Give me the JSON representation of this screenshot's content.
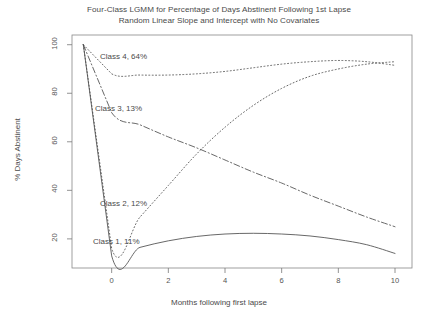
{
  "chart_data": {
    "type": "line",
    "title": "Four-Class LGMM for Percentage of Days Abstinent Following 1st Lapse",
    "subtitle": "Random Linear Slope and Intercept with No Covariates",
    "xlabel": "Months following first lapse",
    "ylabel": "% Days Abstinent",
    "xlim": [
      -1.4,
      10.6
    ],
    "ylim": [
      8,
      104
    ],
    "xticks": [
      0,
      2,
      4,
      6,
      8,
      10
    ],
    "xticklabels": [
      "0",
      "2",
      "4",
      "6",
      "8",
      "10"
    ],
    "yticks": [
      20,
      40,
      60,
      80,
      100
    ],
    "yticklabels": [
      "20",
      "40",
      "60",
      "80",
      "100"
    ],
    "grid": false,
    "legend_position": "inline-annotations",
    "x": [
      -1,
      0,
      1,
      2,
      3,
      4,
      5,
      6,
      7,
      8,
      9,
      10
    ],
    "series": [
      {
        "name": "Class 1",
        "label": "Class 1, 11%",
        "share_pct": 11,
        "linestyle": "solid",
        "values": [
          100,
          13,
          16.5,
          19.2,
          21.0,
          22.0,
          22.3,
          22.0,
          21.2,
          19.7,
          17.6,
          14.0
        ]
      },
      {
        "name": "Class 2",
        "label": "Class 2, 12%",
        "share_pct": 12,
        "linestyle": "dotted",
        "values": [
          100,
          16,
          29,
          42,
          55,
          66,
          75,
          82,
          87,
          90,
          92,
          93
        ]
      },
      {
        "name": "Class 3",
        "label": "Class 3, 13%",
        "share_pct": 13,
        "linestyle": "dashdot",
        "values": [
          100,
          72,
          67,
          62,
          57.5,
          52.5,
          47.5,
          43,
          38,
          33.5,
          29,
          25
        ]
      },
      {
        "name": "Class 4",
        "label": "Class 4, 64%",
        "share_pct": 64,
        "linestyle": "dotted",
        "values": [
          100,
          88,
          87.5,
          87.5,
          88,
          89,
          90.5,
          92,
          93,
          93.5,
          93,
          91.5
        ]
      }
    ],
    "annotations": [
      {
        "name": "class-4-annotation",
        "text": "Class 4, 64%",
        "x_px": 100,
        "y_px": 52
      },
      {
        "name": "class-3-annotation",
        "text": "Class 3, 13%",
        "x_px": 95,
        "y_px": 104
      },
      {
        "name": "class-2-annotation",
        "text": "Class 2, 12%",
        "x_px": 100,
        "y_px": 199
      },
      {
        "name": "class-1-annotation",
        "text": "Class 1, 11%",
        "x_px": 93,
        "y_px": 237
      }
    ],
    "colors": {
      "line": "#4d4d4d",
      "axis": "#777777",
      "text": "#4a4a4a",
      "background": "#ffffff"
    }
  }
}
